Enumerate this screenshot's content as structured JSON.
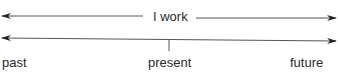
{
  "diagram": {
    "top_arrow": {
      "label": "I work",
      "direction": "both"
    },
    "timeline": {
      "direction": "both",
      "labels": {
        "left": "past",
        "center": "present",
        "right": "future"
      }
    },
    "colors": {
      "line": "#444444",
      "text": "#2a2a2a"
    }
  }
}
